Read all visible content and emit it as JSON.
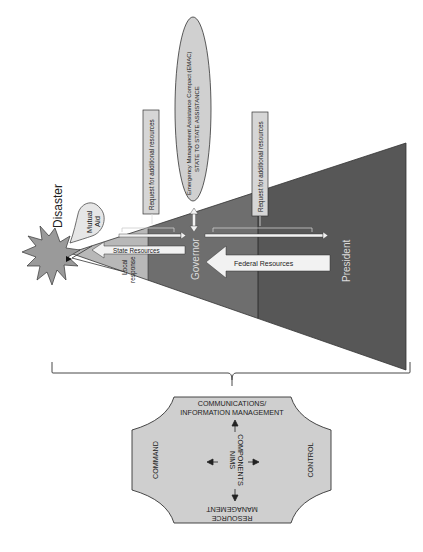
{
  "colors": {
    "local": "#b8b8b8",
    "governor": "#6e6e6e",
    "president": "#575757",
    "burst": "#9a9a9a",
    "nims": "#cfcfcf",
    "box": "#d6d6d6",
    "arrow_fill": "#f2f2f2",
    "outline": "#333333"
  },
  "disaster": {
    "label": "Disaster"
  },
  "mutual_aid": {
    "line1": "Mutual",
    "line2": "Aid"
  },
  "local_response": {
    "line1": "Local",
    "line2": "response"
  },
  "tiers": {
    "governor": "Governor",
    "president": "President"
  },
  "requests": [
    {
      "label": "Request for additional resources"
    },
    {
      "label": "Request for additional resources"
    }
  ],
  "emac": {
    "line1": "Emergency Management Assistance Compact (EMAC)",
    "line2": "STATE TO STATE ASSISTANCE"
  },
  "arrows": {
    "state_resources": "State Resources",
    "federal_resources": "Federal Resources"
  },
  "nims": {
    "center_line1": "NIMS",
    "center_line2": "COMPONENTS",
    "top_line1": "COMMUNICATIONS/",
    "top_line2": "INFORMATION MANAGEMENT",
    "left": "COMMAND",
    "right": "CONTROL",
    "bottom_line1": "RESOURCE",
    "bottom_line2": "MANAGEMENT"
  }
}
